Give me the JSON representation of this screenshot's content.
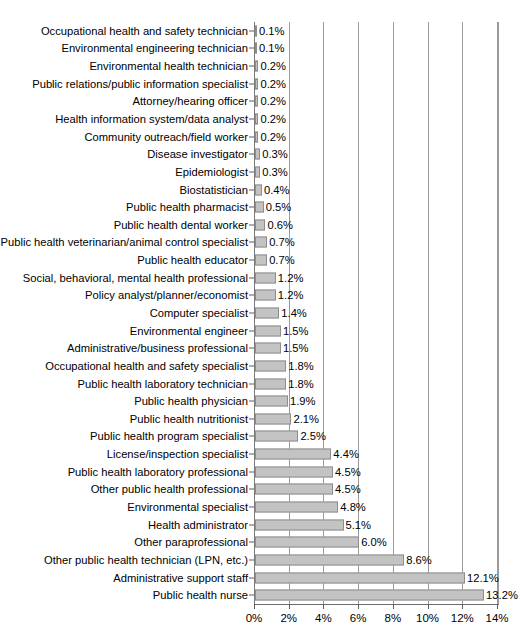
{
  "chart_data": {
    "type": "bar",
    "orientation": "horizontal",
    "title": "",
    "subtitle": "",
    "xlabel": "",
    "ylabel": "",
    "xlim": [
      0,
      14
    ],
    "xtick_labels": [
      "0%",
      "2%",
      "4%",
      "6%",
      "8%",
      "10%",
      "12%",
      "14%"
    ],
    "xticks": [
      0,
      2,
      4,
      6,
      8,
      10,
      12,
      14
    ],
    "grid": "vertical",
    "legend": "none",
    "bar_color": "#c3c3c3",
    "bar_border_color": "#8d8d8d",
    "axis_color": "#7a7a7a",
    "categories": [
      "Occupational health and safety technician",
      "Environmental engineering technician",
      "Environmental health technician",
      "Public relations/public information specialist",
      "Attorney/hearing officer",
      "Health information system/data analyst",
      "Community outreach/field worker",
      "Disease investigator",
      "Epidemiologist",
      "Biostatistician",
      "Public health pharmacist",
      "Public health dental worker",
      "Public health veterinarian/animal control specialist",
      "Public health educator",
      "Social, behavioral, mental health professional",
      "Policy analyst/planner/economist",
      "Computer specialist",
      "Environmental engineer",
      "Administrative/business professional",
      "Occupational health and safety specialist",
      "Public health laboratory technician",
      "Public health physician",
      "Public health nutritionist",
      "Public health program specialist",
      "License/inspection specialist",
      "Public health laboratory professional",
      "Other public health professional",
      "Environmental specialist",
      "Health administrator",
      "Other paraprofessional",
      "Other public health technician (LPN, etc.)",
      "Administrative support staff",
      "Public health nurse"
    ],
    "values": [
      0.1,
      0.1,
      0.2,
      0.2,
      0.2,
      0.2,
      0.2,
      0.3,
      0.3,
      0.4,
      0.5,
      0.6,
      0.7,
      0.7,
      1.2,
      1.2,
      1.4,
      1.5,
      1.5,
      1.8,
      1.8,
      1.9,
      2.1,
      2.5,
      4.4,
      4.5,
      4.5,
      4.8,
      5.1,
      6.0,
      8.6,
      12.1,
      13.2
    ],
    "value_labels": [
      "0.1%",
      "0.1%",
      "0.2%",
      "0.2%",
      "0.2%",
      "0.2%",
      "0.2%",
      "0.3%",
      "0.3%",
      "0.4%",
      "0.5%",
      "0.6%",
      "0.7%",
      "0.7%",
      "1.2%",
      "1.2%",
      "1.4%",
      "1.5%",
      "1.5%",
      "1.8%",
      "1.8%",
      "1.9%",
      "2.1%",
      "2.5%",
      "4.4%",
      "4.5%",
      "4.5%",
      "4.8%",
      "5.1%",
      "6.0%",
      "8.6%",
      "12.1%",
      "13.2%"
    ]
  }
}
